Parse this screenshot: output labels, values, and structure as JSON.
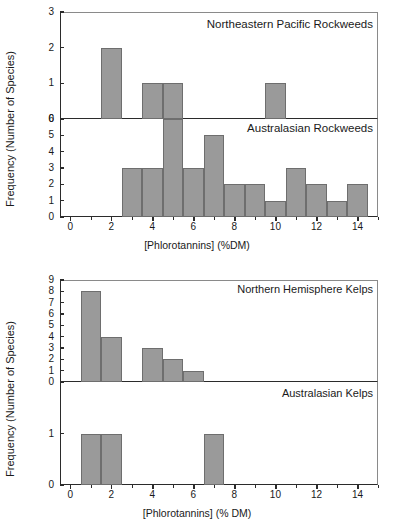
{
  "figures": [
    {
      "id": "rockweeds",
      "ylabel": "Frequency (Number of Species)",
      "xlabel": "[Phlorotannins] (%DM)",
      "panels": [
        {
          "title": "Northeastern Pacific Rockweeds",
          "ylim": [
            0,
            3
          ],
          "yticks": [
            0,
            1,
            2,
            3
          ]
        },
        {
          "title": "Australasian Rockweeds",
          "ylim": [
            0,
            6
          ],
          "yticks": [
            0,
            1,
            2,
            3,
            4,
            5,
            6
          ]
        }
      ],
      "xlim": [
        -0.5,
        15
      ],
      "xticks": [
        0,
        2,
        4,
        6,
        8,
        10,
        12,
        14
      ]
    },
    {
      "id": "kelps",
      "ylabel": "Frequency (Number of Species)",
      "xlabel": "[Phlorotannins] (% DM)",
      "panels": [
        {
          "title": "Northern Hemisphere Kelps",
          "ylim": [
            0,
            9
          ],
          "yticks": [
            0,
            1,
            2,
            3,
            4,
            5,
            6,
            7,
            8,
            9
          ]
        },
        {
          "title": "Australasian Kelps",
          "ylim": [
            0,
            2
          ],
          "yticks": [
            0,
            1
          ]
        }
      ],
      "xlim": [
        -0.5,
        15
      ],
      "xticks": [
        0,
        2,
        4,
        6,
        8,
        10,
        12,
        14
      ]
    }
  ],
  "chart_data": [
    {
      "type": "bar",
      "title": "Northeastern Pacific Rockweeds",
      "xlabel": "[Phlorotannins] (%DM)",
      "ylabel": "Frequency (Number of Species)",
      "xlim": [
        -0.5,
        15
      ],
      "ylim": [
        0,
        3
      ],
      "yticks": [
        0,
        1,
        2,
        3
      ],
      "xticks": [
        0,
        2,
        4,
        6,
        8,
        10,
        12,
        14
      ],
      "grid": false,
      "legend": "none",
      "bin_width": 1,
      "bin_starts": [
        1.5,
        3.5,
        4.5,
        9.5
      ],
      "bin_centers": [
        2,
        4,
        5,
        10
      ],
      "values": [
        2,
        1,
        1,
        1
      ]
    },
    {
      "type": "bar",
      "title": "Australasian Rockweeds",
      "xlabel": "[Phlorotannins] (%DM)",
      "ylabel": "Frequency (Number of Species)",
      "xlim": [
        -0.5,
        15
      ],
      "ylim": [
        0,
        6
      ],
      "yticks": [
        0,
        1,
        2,
        3,
        4,
        5,
        6
      ],
      "xticks": [
        0,
        2,
        4,
        6,
        8,
        10,
        12,
        14
      ],
      "grid": false,
      "legend": "none",
      "bin_width": 1,
      "bin_starts": [
        2.5,
        3.5,
        4.5,
        5.5,
        6.5,
        7.5,
        8.5,
        9.5,
        10.5,
        11.5,
        12.5,
        13.5
      ],
      "bin_centers": [
        3,
        4,
        5,
        6,
        7,
        8,
        9,
        10,
        11,
        12,
        13,
        14
      ],
      "values": [
        3,
        3,
        6,
        3,
        5,
        2,
        2,
        1,
        3,
        2,
        1,
        2
      ]
    },
    {
      "type": "bar",
      "title": "Northern Hemisphere Kelps",
      "xlabel": "[Phlorotannins] (% DM)",
      "ylabel": "Frequency (Number of Species)",
      "xlim": [
        -0.5,
        15
      ],
      "ylim": [
        0,
        9
      ],
      "yticks": [
        0,
        1,
        2,
        3,
        4,
        5,
        6,
        7,
        8,
        9
      ],
      "xticks": [
        0,
        2,
        4,
        6,
        8,
        10,
        12,
        14
      ],
      "grid": false,
      "legend": "none",
      "bin_width": 1,
      "bin_starts": [
        0.5,
        1.5,
        3.5,
        4.5,
        5.5
      ],
      "bin_centers": [
        1,
        2,
        4,
        5,
        6
      ],
      "values": [
        8,
        4,
        3,
        2,
        1
      ]
    },
    {
      "type": "bar",
      "title": "Australasian Kelps",
      "xlabel": "[Phlorotannins] (% DM)",
      "ylabel": "Frequency (Number of Species)",
      "xlim": [
        -0.5,
        15
      ],
      "ylim": [
        0,
        2
      ],
      "yticks": [
        0,
        1
      ],
      "xticks": [
        0,
        2,
        4,
        6,
        8,
        10,
        12,
        14
      ],
      "grid": false,
      "legend": "none",
      "bin_width": 1,
      "bin_starts": [
        0.5,
        1.5,
        6.5
      ],
      "bin_centers": [
        1,
        2,
        7
      ],
      "values": [
        1,
        1,
        1
      ]
    }
  ],
  "style": {
    "bar_fill": "#9a9a9a",
    "bar_stroke": "#6e6e6e",
    "axis_color": "#2b2b2b",
    "background": "#ffffff"
  }
}
